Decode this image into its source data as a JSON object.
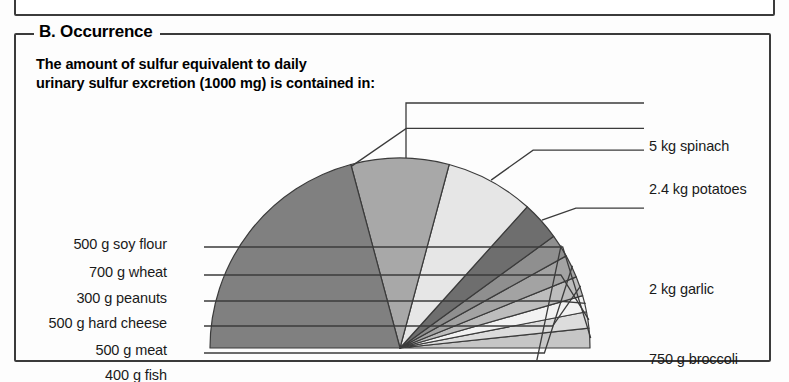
{
  "panel": {
    "label": "B. Occurrence",
    "subtitle": "The amount of sulfur equivalent to daily\nurinary sulfur excretion (1000 mg) is contained in:"
  },
  "chart_data": {
    "type": "pie",
    "title": "B. Occurrence",
    "subtitle": "The amount of sulfur equivalent to daily urinary sulfur excretion (1000 mg) is contained in:",
    "shape": "semicircle",
    "total_degrees": 180,
    "legend": "callout-labels",
    "grid": false,
    "units": "food mass containing 1000 mg sulfur",
    "labels": [
      "5 kg spinach",
      "2.4 kg potatoes",
      "2 kg garlic",
      "750 g broccoli",
      "400 g fish",
      "500 g meat",
      "500 g hard cheese",
      "300 g peanuts",
      "700 g wheat",
      "500 g soy flour"
    ],
    "slices": [
      {
        "label": "5 kg spinach",
        "degrees": 75,
        "color": "#808080",
        "side": "right"
      },
      {
        "label": "2.4 kg potatoes",
        "degrees": 30,
        "color": "#a8a8a8",
        "side": "right"
      },
      {
        "label": "2 kg garlic",
        "degrees": 27,
        "color": "#e6e6e6",
        "side": "right"
      },
      {
        "label": "750 g broccoli",
        "degrees": 12,
        "color": "#6e6e6e",
        "side": "right"
      },
      {
        "label": "400 g fish",
        "degrees": 7,
        "color": "#8f8f8f",
        "side": "left"
      },
      {
        "label": "500 g meat",
        "degrees": 7,
        "color": "#a3a3a3",
        "side": "left"
      },
      {
        "label": "500 g hard cheese",
        "degrees": 6,
        "color": "#bdbdbd",
        "side": "left"
      },
      {
        "label": "300 g peanuts",
        "degrees": 5,
        "color": "#f2f2f2",
        "side": "left"
      },
      {
        "label": "700 g wheat",
        "degrees": 5,
        "color": "#dcdcdc",
        "side": "left"
      },
      {
        "label": "500 g soy flour",
        "degrees": 6,
        "color": "#c6c6c6",
        "side": "left"
      }
    ],
    "colors": {
      "outline": "#3b3b3b",
      "leader": "#3b3b3b",
      "panel_border": "#3b3b3b",
      "text": "#1a1a1a"
    }
  },
  "callouts": {
    "right": [
      {
        "name": "spinach",
        "text": "5 kg spinach"
      },
      {
        "name": "potatoes",
        "text": "2.4 kg potatoes"
      },
      {
        "name": "garlic",
        "text": "2 kg garlic"
      },
      {
        "name": "broccoli",
        "text": "750 g broccoli"
      }
    ],
    "left": [
      {
        "name": "soy-flour",
        "text": "500 g soy flour"
      },
      {
        "name": "wheat",
        "text": "700 g wheat"
      },
      {
        "name": "peanuts",
        "text": "300 g peanuts"
      },
      {
        "name": "hard-cheese",
        "text": "500 g hard cheese"
      },
      {
        "name": "meat",
        "text": "500 g meat"
      },
      {
        "name": "fish",
        "text": "400 g fish"
      }
    ]
  }
}
